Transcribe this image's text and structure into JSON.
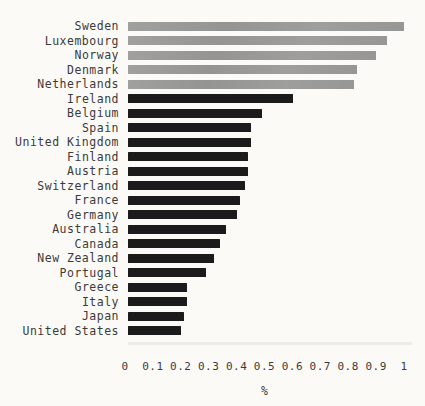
{
  "chart_data": {
    "type": "bar",
    "orientation": "horizontal",
    "title": "",
    "xlabel": "%",
    "xlim": [
      0,
      1
    ],
    "grid": false,
    "legend": false,
    "categories": [
      "Sweden",
      "Luxembourg",
      "Norway",
      "Denmark",
      "Netherlands",
      "Ireland",
      "Belgium",
      "Spain",
      "United Kingdom",
      "Finland",
      "Austria",
      "Switzerland",
      "France",
      "Germany",
      "Australia",
      "Canada",
      "New Zealand",
      "Portugal",
      "Greece",
      "Italy",
      "Japan",
      "United States"
    ],
    "values": [
      0.99,
      0.93,
      0.89,
      0.82,
      0.81,
      0.59,
      0.48,
      0.44,
      0.44,
      0.43,
      0.43,
      0.42,
      0.4,
      0.39,
      0.35,
      0.33,
      0.31,
      0.28,
      0.21,
      0.21,
      0.2,
      0.19
    ],
    "highlight_count": 5,
    "x_ticks": [
      "0",
      "0.1",
      "0.2",
      "0.3",
      "0.4",
      "0.5",
      "0.6",
      "0.7",
      "0.8",
      "0.9",
      "1"
    ],
    "x_tick_values": [
      0,
      0.1,
      0.2,
      0.3,
      0.4,
      0.5,
      0.6,
      0.7,
      0.8,
      0.9,
      1
    ]
  },
  "colors": {
    "highlight_bar": "#9a9a98",
    "default_bar": "#1b1b1b",
    "text": "#3b3b3b",
    "background": "#fbfaf7"
  }
}
